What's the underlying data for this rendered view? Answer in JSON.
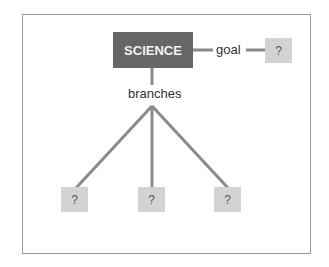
{
  "diagram": {
    "root": {
      "label": "SCIENCE"
    },
    "goal": {
      "edge_label": "goal",
      "node_label": "?"
    },
    "branches": {
      "edge_label": "branches",
      "nodes": [
        {
          "label": "?"
        },
        {
          "label": "?"
        },
        {
          "label": "?"
        }
      ]
    },
    "colors": {
      "root_fill": "#666666",
      "root_text": "#f2f2f2",
      "unknown_fill": "#d3d3d3",
      "line": "#8a8a8a",
      "frame": "#9a9a9a"
    }
  }
}
